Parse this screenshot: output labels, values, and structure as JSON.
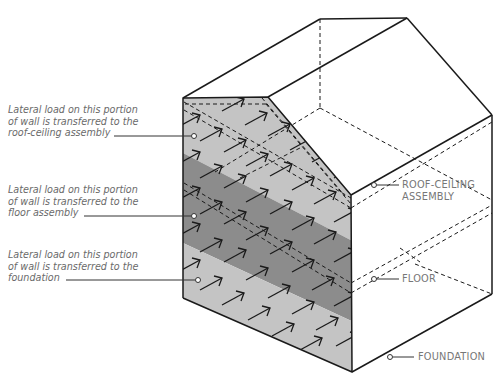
{
  "diagram": {
    "colors": {
      "light_band": "#c4c4c4",
      "dark_band": "#8c8c8c",
      "stroke": "#1a1a1a",
      "label_text": "#6a6a6a"
    },
    "left_labels": [
      {
        "id": "roof",
        "lines": [
          "Lateral load on this portion",
          "of wall is transferred to the",
          "roof-ceiling assembly"
        ]
      },
      {
        "id": "floor",
        "lines": [
          "Lateral load on this portion",
          "of wall is transferred to the",
          "floor assembly"
        ]
      },
      {
        "id": "foundation",
        "lines": [
          "Lateral load on this portion",
          "of wall is transferred to the",
          "foundation"
        ]
      }
    ],
    "right_labels": [
      {
        "id": "roof",
        "lines": [
          "ROOF-CEILING",
          "ASSEMBLY"
        ]
      },
      {
        "id": "floor",
        "lines": [
          "FLOOR"
        ]
      },
      {
        "id": "foundation",
        "lines": [
          "FOUNDATION"
        ]
      }
    ]
  }
}
